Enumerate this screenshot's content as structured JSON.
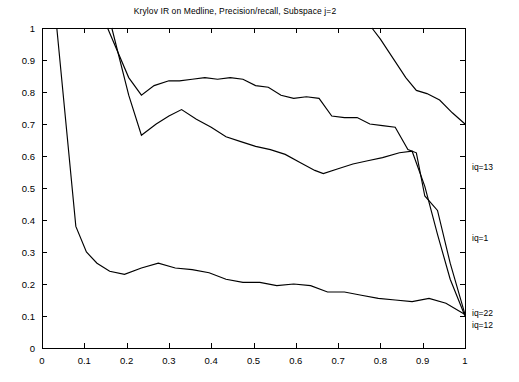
{
  "chart_data": {
    "type": "line",
    "title": "Krylov IR on Medline, Precision/recall, Subspace j=2",
    "xlabel": "",
    "ylabel": "",
    "xlim": [
      0,
      1
    ],
    "ylim": [
      0,
      1
    ],
    "grid": false,
    "legend_position": "right-edge-annotations",
    "xticks": [
      "0",
      "0.1",
      "0.2",
      "0.3",
      "0.4",
      "0.5",
      "0.6",
      "0.7",
      "0.8",
      "0.9",
      "1"
    ],
    "xtick_values": [
      0,
      0.1,
      0.2,
      0.3,
      0.4,
      0.5,
      0.6,
      0.7,
      0.8,
      0.9,
      1
    ],
    "yticks": [
      "0",
      "0.1",
      "0.2",
      "0.3",
      "0.4",
      "0.5",
      "0.6",
      "0.7",
      "0.8",
      "0.9",
      "1"
    ],
    "ytick_values": [
      0,
      0.1,
      0.2,
      0.3,
      0.4,
      0.5,
      0.6,
      0.7,
      0.8,
      0.9,
      1
    ],
    "line_color": "#000000",
    "background_color": "#ffffff",
    "series": [
      {
        "name": "iq=13",
        "label": "iq=13",
        "label_y": 0.565,
        "x": [
          0.78,
          0.8,
          0.83,
          0.86,
          0.885,
          0.91,
          0.94,
          0.97,
          1.0
        ],
        "y": [
          1.0,
          0.965,
          0.905,
          0.845,
          0.805,
          0.795,
          0.775,
          0.735,
          0.7
        ]
      },
      {
        "name": "iq=22",
        "label": "iq=22",
        "label_y": 0.108,
        "x": [
          0.155,
          0.205,
          0.235,
          0.265,
          0.3,
          0.325,
          0.355,
          0.385,
          0.415,
          0.445,
          0.475,
          0.505,
          0.535,
          0.565,
          0.595,
          0.625,
          0.655,
          0.685,
          0.715,
          0.745,
          0.775,
          0.805,
          0.835,
          0.865,
          0.885,
          0.905,
          0.935,
          0.965,
          1.0
        ],
        "y": [
          1.0,
          0.845,
          0.79,
          0.82,
          0.835,
          0.835,
          0.84,
          0.845,
          0.84,
          0.845,
          0.84,
          0.82,
          0.815,
          0.79,
          0.78,
          0.785,
          0.78,
          0.725,
          0.72,
          0.72,
          0.7,
          0.695,
          0.69,
          0.62,
          0.61,
          0.475,
          0.43,
          0.265,
          0.105
        ]
      },
      {
        "name": "iq=12",
        "label": "iq=12",
        "label_y": 0.072,
        "x": [
          0.165,
          0.205,
          0.235,
          0.27,
          0.3,
          0.33,
          0.365,
          0.4,
          0.435,
          0.47,
          0.505,
          0.54,
          0.575,
          0.61,
          0.645,
          0.665,
          0.7,
          0.735,
          0.77,
          0.805,
          0.845,
          0.875,
          0.905,
          0.935,
          0.965,
          1.0
        ],
        "y": [
          1.0,
          0.79,
          0.665,
          0.7,
          0.725,
          0.745,
          0.715,
          0.69,
          0.66,
          0.645,
          0.63,
          0.62,
          0.605,
          0.58,
          0.555,
          0.545,
          0.56,
          0.575,
          0.585,
          0.595,
          0.61,
          0.615,
          0.505,
          0.355,
          0.215,
          0.1
        ]
      },
      {
        "name": "iq=1",
        "label": "iq=1",
        "label_y": 0.345,
        "x": [
          0.035,
          0.08,
          0.105,
          0.13,
          0.16,
          0.195,
          0.235,
          0.275,
          0.315,
          0.355,
          0.395,
          0.435,
          0.475,
          0.515,
          0.555,
          0.595,
          0.635,
          0.675,
          0.715,
          0.755,
          0.795,
          0.835,
          0.875,
          0.915,
          0.955,
          1.0
        ],
        "y": [
          1.0,
          0.38,
          0.3,
          0.265,
          0.24,
          0.23,
          0.25,
          0.265,
          0.25,
          0.245,
          0.235,
          0.215,
          0.205,
          0.205,
          0.195,
          0.2,
          0.195,
          0.175,
          0.175,
          0.165,
          0.155,
          0.15,
          0.145,
          0.155,
          0.14,
          0.105
        ]
      }
    ]
  }
}
